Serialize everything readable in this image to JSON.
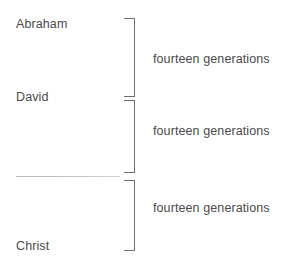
{
  "diagram": {
    "type": "bracket-genealogy",
    "nodes": [
      {
        "id": "abraham",
        "label": "Abraham"
      },
      {
        "id": "david",
        "label": "David"
      },
      {
        "id": "blank",
        "label": ""
      },
      {
        "id": "christ",
        "label": "Christ"
      }
    ],
    "spans": [
      {
        "id": "span-1",
        "label": "fourteen generations",
        "from": "Abraham",
        "to": "David"
      },
      {
        "id": "span-2",
        "label": "fourteen generations",
        "from": "David",
        "to": ""
      },
      {
        "id": "span-3",
        "label": "fourteen generations",
        "from": "",
        "to": "Christ"
      }
    ],
    "colors": {
      "background": "#ffffff",
      "text": "#4a4a4a",
      "bracket": "#6f6f6f",
      "rule": "#c3c3c3"
    }
  }
}
